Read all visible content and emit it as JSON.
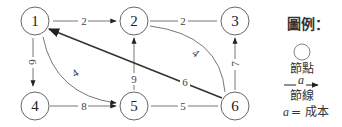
{
  "diagram": {
    "type": "directed-network",
    "nodes": [
      {
        "id": "1",
        "label": "1"
      },
      {
        "id": "2",
        "label": "2"
      },
      {
        "id": "3",
        "label": "3"
      },
      {
        "id": "4",
        "label": "4"
      },
      {
        "id": "5",
        "label": "5"
      },
      {
        "id": "6",
        "label": "6"
      }
    ],
    "edges": [
      {
        "from": "1",
        "to": "2",
        "cost": "2",
        "directed": true
      },
      {
        "from": "2",
        "to": "3",
        "cost": "2",
        "directed": false
      },
      {
        "from": "1",
        "to": "4",
        "cost": "6",
        "directed": true
      },
      {
        "from": "1",
        "to": "5",
        "cost": "4",
        "directed": true
      },
      {
        "from": "4",
        "to": "5",
        "cost": "8",
        "directed": true
      },
      {
        "from": "5",
        "to": "2",
        "cost": "9",
        "directed": true
      },
      {
        "from": "6",
        "to": "1",
        "cost": "6",
        "directed": true
      },
      {
        "from": "2",
        "to": "6",
        "cost": "4",
        "directed": false
      },
      {
        "from": "6",
        "to": "3",
        "cost": "7",
        "directed": true
      },
      {
        "from": "5",
        "to": "6",
        "cost": "5",
        "directed": false
      }
    ]
  },
  "legend": {
    "title": "圖例：",
    "node_label": "節點",
    "edge_symbol": "a",
    "edge_label": "節線",
    "cost_var": "a",
    "cost_eq": "= 成本"
  }
}
